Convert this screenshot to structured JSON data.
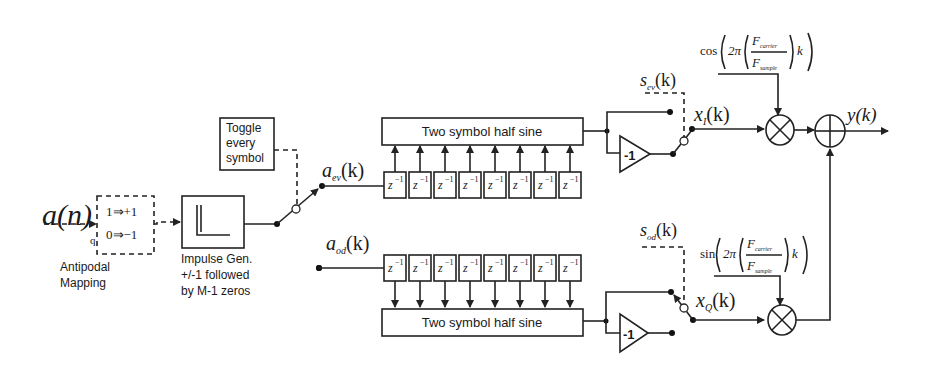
{
  "diagram": {
    "input": {
      "label": "a(n)",
      "tap_label": "q"
    },
    "antipodal": {
      "rule1": "1⇒+1",
      "rule0": "0⇒−1",
      "caption_line1": "Antipodal",
      "caption_line2": "Mapping"
    },
    "impulse_gen": {
      "caption_line1": "Impulse Gen.",
      "caption_line2": "+/-1 followed",
      "caption_line3": "by M-1 zeros"
    },
    "toggle": {
      "line1": "Toggle",
      "line2": "every",
      "line3": "symbol"
    },
    "even_branch": {
      "signal_label": "a",
      "signal_sub": "ev",
      "signal_arg": "(k)",
      "delay_label": "z",
      "delay_exp": "−1",
      "delay_count": 8,
      "filter_label": "Two symbol half sine",
      "inverter_label": "-1",
      "switch_ctrl": "s",
      "switch_ctrl_sub": "ev",
      "switch_ctrl_arg": "(k)",
      "output_label": "x",
      "output_sub": "I",
      "output_arg": "(k)"
    },
    "odd_branch": {
      "signal_label": "a",
      "signal_sub": "od",
      "signal_arg": "(k)",
      "delay_label": "z",
      "delay_exp": "−1",
      "delay_count": 8,
      "filter_label": "Two symbol half sine",
      "inverter_label": "-1",
      "switch_ctrl": "s",
      "switch_ctrl_sub": "od",
      "switch_ctrl_arg": "(k)",
      "output_label": "x",
      "output_sub": "Q",
      "output_arg": "(k)"
    },
    "carrier_cos": {
      "func": "cos",
      "two_pi": "2π",
      "num": "F",
      "num_sub": "carrier",
      "den": "F",
      "den_sub": "sample",
      "var": "k"
    },
    "carrier_sin": {
      "func": "sin",
      "two_pi": "2π",
      "num": "F",
      "num_sub": "carrier",
      "den": "F",
      "den_sub": "sample",
      "var": "k"
    },
    "output": {
      "label": "y(k)"
    }
  }
}
